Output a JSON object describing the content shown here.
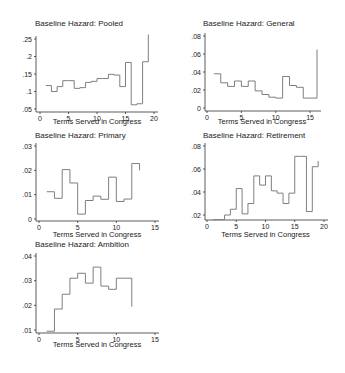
{
  "chart_data": [
    {
      "type": "line",
      "style": "step",
      "title": "Baseline Hazard: Pooled",
      "xlabel": "Terms Served in Congress",
      "ylabel": "",
      "xlim": [
        0,
        20
      ],
      "ylim": [
        0.05,
        0.26
      ],
      "xticks": [
        "0",
        "5",
        "10",
        "15",
        "20"
      ],
      "yticks": [
        ".05",
        ".1",
        ".15",
        ".2",
        ".25"
      ],
      "grid": false,
      "x": [
        1,
        2,
        3,
        4,
        5,
        6,
        7,
        8,
        9,
        10,
        11,
        12,
        13,
        14,
        15,
        16,
        17,
        18,
        19
      ],
      "values": [
        0.117,
        0.1,
        0.114,
        0.131,
        0.131,
        0.109,
        0.111,
        0.126,
        0.129,
        0.137,
        0.137,
        0.149,
        0.147,
        0.114,
        0.183,
        0.062,
        0.065,
        0.185,
        0.263
      ]
    },
    {
      "type": "line",
      "style": "step",
      "title": "Baseline Hazard: General",
      "xlabel": "Terms Served in Congress",
      "ylabel": "",
      "xlim": [
        0,
        16
      ],
      "ylim": [
        0,
        0.08
      ],
      "xticks": [
        "0",
        "5",
        "10",
        "15"
      ],
      "yticks": [
        "0",
        ".02",
        ".04",
        ".06",
        ".08"
      ],
      "grid": false,
      "x": [
        1,
        2,
        3,
        4,
        5,
        6,
        7,
        8,
        9,
        10,
        11,
        12,
        13,
        14,
        15,
        16
      ],
      "values": [
        0.038,
        0.028,
        0.024,
        0.03,
        0.024,
        0.03,
        0.019,
        0.015,
        0.012,
        0.011,
        0.035,
        0.025,
        0.023,
        0.011,
        0.011,
        0.065
      ]
    },
    {
      "type": "line",
      "style": "step",
      "title": "Baseline Hazard: Primary",
      "xlabel": "Terms Served in Congress",
      "ylabel": "",
      "xlim": [
        0,
        15
      ],
      "ylim": [
        0,
        0.03
      ],
      "xticks": [
        "0",
        "5",
        "10",
        "15"
      ],
      "yticks": [
        "0",
        ".01",
        ".02",
        ".03"
      ],
      "grid": false,
      "x": [
        1,
        2,
        3,
        4,
        5,
        6,
        7,
        8,
        9,
        10,
        11,
        12,
        13
      ],
      "values": [
        0.0112,
        0.0085,
        0.0203,
        0.0148,
        0.002,
        0.0076,
        0.0094,
        0.0081,
        0.0172,
        0.0072,
        0.0082,
        0.0228,
        0.02
      ]
    },
    {
      "type": "line",
      "style": "step",
      "title": "Baseline Hazard: Retirement",
      "xlabel": "Terms Served in Congress",
      "ylabel": "",
      "xlim": [
        0,
        20
      ],
      "ylim": [
        0.015,
        0.08
      ],
      "xticks": [
        "0",
        "5",
        "10",
        "15",
        "20"
      ],
      "yticks": [
        ".02",
        ".04",
        ".06",
        ".08"
      ],
      "grid": false,
      "x": [
        1,
        2,
        3,
        4,
        5,
        6,
        7,
        8,
        9,
        10,
        11,
        12,
        13,
        14,
        15,
        16,
        17,
        18,
        19
      ],
      "values": [
        0.016,
        0.016,
        0.02,
        0.025,
        0.043,
        0.021,
        0.03,
        0.054,
        0.046,
        0.054,
        0.041,
        0.039,
        0.03,
        0.039,
        0.071,
        0.071,
        0.023,
        0.062,
        0.067
      ]
    },
    {
      "type": "line",
      "style": "step",
      "title": "Baseline Hazard: Ambition",
      "xlabel": "Terms Served in Congress",
      "ylabel": "",
      "xlim": [
        0,
        15
      ],
      "ylim": [
        0.009,
        0.04
      ],
      "xticks": [
        "0",
        "5",
        "10",
        "15"
      ],
      "yticks": [
        ".01",
        ".02",
        ".03",
        ".04"
      ],
      "grid": false,
      "x": [
        1,
        2,
        3,
        4,
        5,
        6,
        7,
        8,
        9,
        10,
        11,
        12
      ],
      "values": [
        0.0095,
        0.0185,
        0.0245,
        0.031,
        0.033,
        0.029,
        0.0355,
        0.0278,
        0.0265,
        0.031,
        0.031,
        0.0195
      ]
    }
  ],
  "panels": [
    {
      "title": "Baseline Hazard: Pooled",
      "xlabel": "Terms Served in Congress"
    },
    {
      "title": "Baseline Hazard: General",
      "xlabel": "Terms Served in Congress"
    },
    {
      "title": "Baseline Hazard: Primary",
      "xlabel": "Terms Served in Congress"
    },
    {
      "title": "Baseline Hazard: Retirement",
      "xlabel": "Terms Served in Congress"
    },
    {
      "title": "Baseline Hazard: Ambition",
      "xlabel": "Terms Served in Congress"
    }
  ],
  "colors": {
    "line": "#7f7f7f",
    "axis": "#333333",
    "text": "#1a1a1a",
    "background": "#ffffff"
  }
}
